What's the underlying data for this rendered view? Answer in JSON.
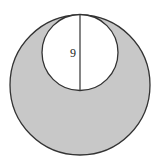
{
  "diagram": {
    "type": "geometry",
    "outer_circle": {
      "cx": 80,
      "cy": 85,
      "r": 70
    },
    "inner_circle": {
      "cx": 80,
      "cy": 52.5,
      "r": 38
    },
    "diameter_segment": {
      "x": 80,
      "y1": 14.5,
      "y2": 90.5
    },
    "label": "9",
    "colors": {
      "shaded": "#c8c8c8",
      "stroke": "#333333",
      "background": "#ffffff",
      "inner_fill": "#ffffff"
    }
  }
}
